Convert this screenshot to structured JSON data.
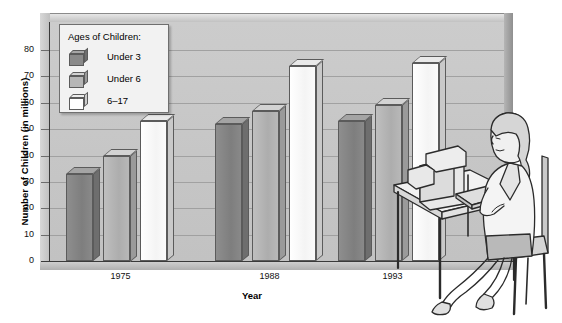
{
  "chart_data": {
    "type": "bar",
    "title": "",
    "xlabel": "Year",
    "ylabel": "Number of Children (in millions)",
    "categories": [
      "1975",
      "1988",
      "1993"
    ],
    "ylim": [
      0,
      85
    ],
    "yticks": [
      0,
      10,
      20,
      30,
      40,
      50,
      60,
      70,
      80
    ],
    "grid": true,
    "legend_position": "upper-left-inside",
    "legend_title": "Ages of Children:",
    "series": [
      {
        "name": "Under 3",
        "color": "#8a8a8a",
        "values": [
          33,
          52,
          53
        ]
      },
      {
        "name": "Under 6",
        "color": "#b6b6b6",
        "values": [
          40,
          57,
          59
        ]
      },
      {
        "name": "6-17",
        "color": "#ffffff",
        "values": [
          53,
          74,
          75
        ]
      }
    ]
  },
  "axes": {
    "y_title": "Number of Children (in millions)",
    "x_title": "Year",
    "y_tick_labels": [
      "80",
      "70",
      "60",
      "50",
      "40",
      "30",
      "20",
      "10",
      "0"
    ],
    "x_tick_labels": [
      "1975",
      "1988",
      "1993"
    ]
  },
  "legend": {
    "title": "Ages of Children:",
    "items": [
      {
        "label": "Under 3",
        "swatch": "dark-gray-cube-icon"
      },
      {
        "label": "Under 6",
        "swatch": "medium-gray-cube-icon"
      },
      {
        "label": "6–17",
        "swatch": "white-cube-icon"
      }
    ]
  },
  "illustration": {
    "name": "woman-at-computer-desk-illustration",
    "description": ""
  },
  "colors": {
    "under3": "#8a8a8a",
    "under6": "#b6b6b6",
    "six17": "#ffffff",
    "wall": "#c6c6c6",
    "gridline": "#9a9a9a",
    "axis": "#3a3a3a"
  }
}
